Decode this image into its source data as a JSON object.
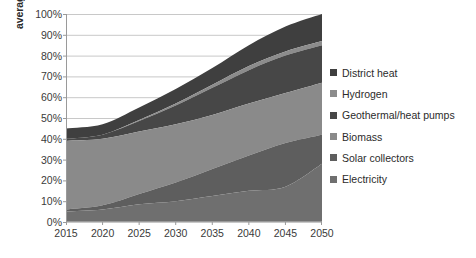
{
  "chart_data": {
    "type": "area",
    "stacked": true,
    "title": "",
    "xlabel": "",
    "ylabel": "average global heat generation share",
    "x": [
      2015,
      2020,
      2025,
      2030,
      2035,
      2040,
      2045,
      2050
    ],
    "xtick_labels": [
      "2015",
      "2020",
      "2025",
      "2030",
      "2035",
      "2040",
      "2045",
      "2050"
    ],
    "xlim": [
      2015,
      2050
    ],
    "ylim": [
      0,
      100
    ],
    "ytick_labels": [
      "100%",
      "90%",
      "80%",
      "70%",
      "60%",
      "50%",
      "40%",
      "30%",
      "20%",
      "10%",
      "0%"
    ],
    "ytick_values": [
      100,
      90,
      80,
      70,
      60,
      50,
      40,
      30,
      20,
      10,
      0
    ],
    "grid": "horizontal",
    "legend_position": "right",
    "stack_order_bottom_to_top": [
      "Electricity",
      "Solar collectors",
      "Biomass",
      "Geothermal/heat pumps",
      "Hydrogen",
      "District heat"
    ],
    "series": [
      {
        "name": "District heat",
        "color": "#3f3f3f",
        "values": [
          5,
          5,
          6,
          7,
          8,
          10,
          12,
          13
        ],
        "cumulative_top": [
          45,
          47,
          55,
          64,
          74,
          85,
          94,
          100
        ]
      },
      {
        "name": "Hydrogen",
        "color": "#8c8c8c",
        "values": [
          0,
          0,
          0.5,
          1,
          1.5,
          2,
          2,
          2
        ],
        "cumulative_top": [
          40,
          42,
          49,
          57,
          66,
          75,
          82,
          87
        ]
      },
      {
        "name": "Geothermal/heat pumps",
        "color": "#474747",
        "values": [
          1,
          2,
          5,
          9,
          13,
          16,
          18,
          18
        ],
        "cumulative_top": [
          40,
          42,
          48.5,
          56,
          64.5,
          73,
          80,
          85
        ]
      },
      {
        "name": "Biomass",
        "color": "#8a8a8a",
        "values": [
          33,
          32,
          30,
          28,
          26,
          25,
          24,
          25
        ],
        "cumulative_top": [
          39,
          40,
          43.5,
          47,
          51.5,
          57,
          62,
          67
        ]
      },
      {
        "name": "Solar collectors",
        "color": "#5e5e5e",
        "values": [
          1,
          2,
          5,
          9,
          13,
          17,
          21,
          14
        ],
        "cumulative_top": [
          6,
          8,
          13.5,
          19,
          25.5,
          32,
          38,
          42
        ]
      },
      {
        "name": "Electricity",
        "color": "#6f6f6f",
        "values": [
          5,
          6,
          8.5,
          10,
          12.5,
          15,
          17,
          28
        ],
        "cumulative_top": [
          5,
          6,
          8.5,
          10,
          12.5,
          15,
          17,
          28
        ]
      }
    ],
    "legend_entries": [
      {
        "label": "District heat",
        "color": "#3f3f3f"
      },
      {
        "label": "Hydrogen",
        "color": "#8c8c8c"
      },
      {
        "label": "Geothermal/heat pumps",
        "color": "#474747"
      },
      {
        "label": "Biomass",
        "color": "#8a8a8a"
      },
      {
        "label": "Solar collectors",
        "color": "#5e5e5e"
      },
      {
        "label": "Electricity",
        "color": "#6f6f6f"
      }
    ],
    "axis_color": "#9a9a9a",
    "grid_color": "#c8c8c8"
  }
}
